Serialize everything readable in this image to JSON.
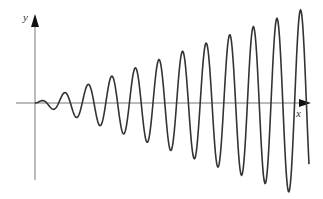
{
  "chart_data": {
    "type": "line",
    "title": "",
    "xlabel": "x",
    "ylabel": "y",
    "function": "y = k * x * sin(omega * x)",
    "grid": false,
    "legend": null,
    "axes": {
      "origin_px": [
        35,
        103
      ],
      "x_axis_px": {
        "from": 16,
        "to": 310
      },
      "y_axis_px": {
        "from": 180,
        "to": 14
      }
    },
    "model": {
      "period_px": 23.6,
      "amplitude_slope": 0.35,
      "x_start_px": 35,
      "x_end_px": 309
    },
    "peaks_px": [
      [
        41,
        101
      ],
      [
        65,
        93
      ],
      [
        89,
        85
      ],
      [
        112,
        77
      ],
      [
        136,
        68
      ],
      [
        159,
        60
      ],
      [
        183,
        52
      ],
      [
        207,
        43
      ],
      [
        230,
        35
      ],
      [
        254,
        27
      ],
      [
        277,
        18
      ],
      [
        302,
        10
      ]
    ],
    "troughs_px": [
      [
        53,
        108
      ],
      [
        77,
        118
      ],
      [
        100,
        126
      ],
      [
        124,
        134
      ],
      [
        148,
        142
      ],
      [
        171,
        150
      ],
      [
        195,
        158
      ],
      [
        218,
        166
      ],
      [
        242,
        174
      ],
      [
        266,
        182
      ],
      [
        290,
        190
      ]
    ]
  },
  "labels": {
    "x_axis": "x",
    "y_axis": "y"
  },
  "colors": {
    "curve": "#333333",
    "axis": "#666666",
    "arrow": "#111111"
  }
}
